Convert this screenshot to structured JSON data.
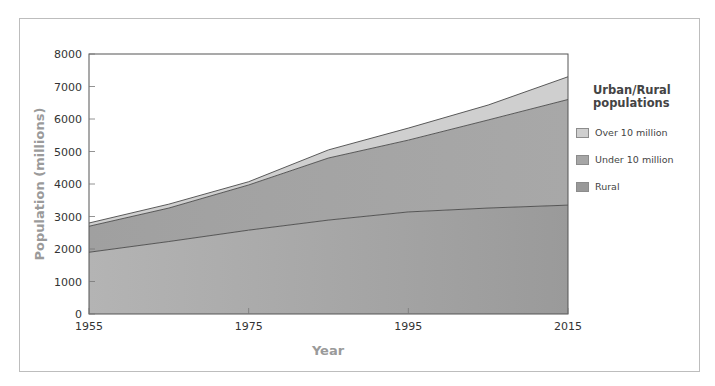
{
  "chart_data": {
    "type": "area",
    "stacked": true,
    "title": "",
    "xlabel": "Year",
    "ylabel": "Population (millions)",
    "x": [
      1955,
      1965,
      1975,
      1985,
      1995,
      2005,
      2015
    ],
    "xticks": [
      "1955",
      "1975",
      "1995",
      "2015"
    ],
    "yticks": [
      "0",
      "1000",
      "2000",
      "3000",
      "4000",
      "5000",
      "6000",
      "7000",
      "8000"
    ],
    "ylim": [
      0,
      8000
    ],
    "xlim": [
      1955,
      2015
    ],
    "grid": false,
    "legend_position": "right",
    "legend_title": "Urban/Rural populations",
    "series": [
      {
        "name": "Rural",
        "color": "#9e9e9e",
        "values": [
          1900,
          2230,
          2580,
          2890,
          3140,
          3260,
          3350
        ]
      },
      {
        "name": "Under 10 million",
        "color": "#a6a6a6",
        "values": [
          800,
          1030,
          1390,
          1910,
          2210,
          2710,
          3250
        ]
      },
      {
        "name": "Over 10 million",
        "color": "#cfcfcf",
        "values": [
          100,
          120,
          100,
          250,
          370,
          460,
          700
        ]
      }
    ],
    "totals": [
      2800,
      3380,
      4070,
      5050,
      5720,
      6430,
      7300
    ]
  },
  "legend": {
    "title_line1": "Urban/Rural",
    "title_line2": "populations",
    "items": [
      {
        "label": "Over 10 million",
        "color": "#cfcfcf"
      },
      {
        "label": "Under 10 million",
        "color": "#a6a6a6"
      },
      {
        "label": "Rural",
        "color": "#999999"
      }
    ]
  },
  "axes": {
    "x_title": "Year",
    "y_title": "Population (millions)"
  }
}
